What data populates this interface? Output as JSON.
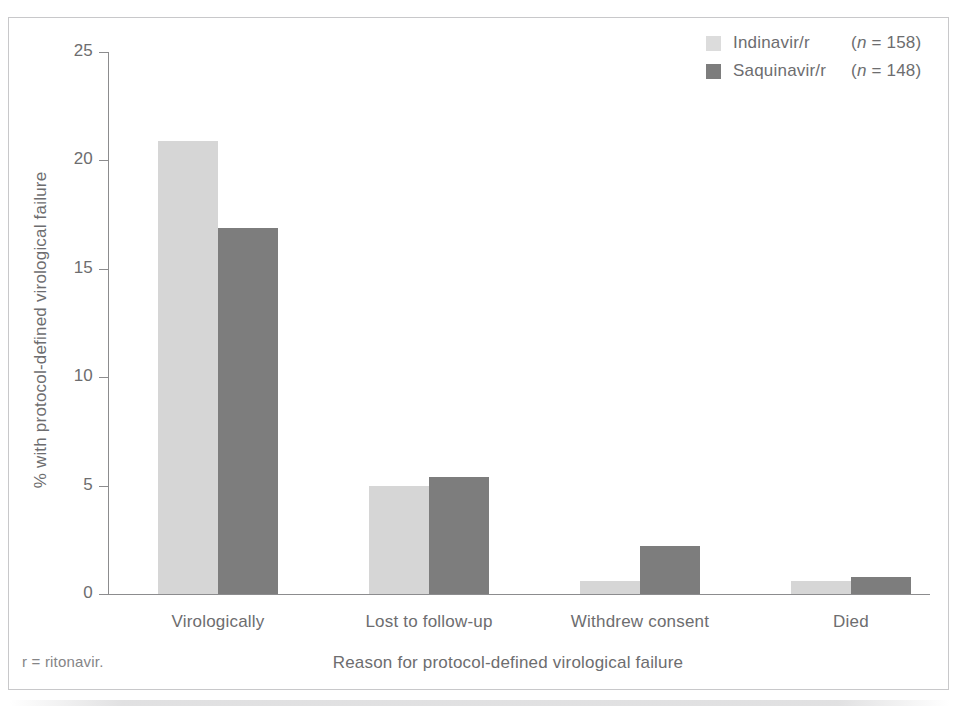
{
  "figure": {
    "top_sliver_text": "",
    "footnote": "r = ritonavir."
  },
  "legend": {
    "items": [
      {
        "label": "Indinavir/r",
        "n_text": "(n = 158)",
        "n_prefix": "(",
        "n_italic": "n",
        "n_suffix": " = 158)",
        "color": "#dcdcdc"
      },
      {
        "label": "Saquinavir/r",
        "n_text": "(n = 148)",
        "n_prefix": "(",
        "n_italic": "n",
        "n_suffix": " = 148)",
        "color": "#7d7d7d"
      }
    ]
  },
  "chart_data": {
    "type": "bar",
    "title": "",
    "xlabel": "Reason for protocol-defined virological failure",
    "ylabel": "% with protocol-defined virological failure",
    "categories": [
      "Virologically",
      "Lost to follow-up",
      "Withdrew consent",
      "Died"
    ],
    "series": [
      {
        "name": "Indinavir/r",
        "color": "#d6d6d6",
        "values": [
          20.9,
          5.0,
          0.6,
          0.6
        ]
      },
      {
        "name": "Saquinavir/r",
        "color": "#7d7d7d",
        "values": [
          16.9,
          5.4,
          2.2,
          0.8
        ]
      }
    ],
    "ylim": [
      0,
      25
    ],
    "yticks": [
      0,
      5,
      10,
      15,
      20,
      25
    ],
    "ytick_labels": [
      "0",
      "5",
      "10",
      "15",
      "20",
      "25"
    ],
    "grid": false,
    "legend_position": "top-right"
  }
}
